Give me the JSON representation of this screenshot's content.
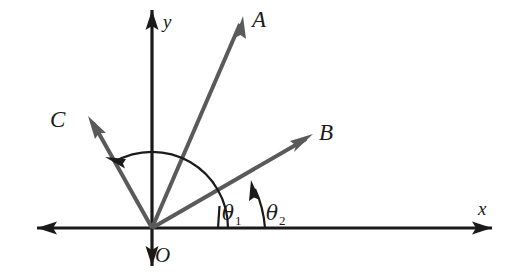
{
  "figure": {
    "kind": "vector-angle-diagram",
    "background_color": "#ffffff",
    "axis_color": "#1a1a1a",
    "vector_color": "#5a5a5a",
    "arc_color": "#1a1a1a",
    "label_color": "#1a1a1a",
    "origin": {
      "x": 152,
      "y": 228,
      "label": "O"
    },
    "axes": [
      {
        "name": "x-axis",
        "label": "x",
        "label_x": 478,
        "label_y": 215,
        "x1": 37,
        "y1": 228,
        "x2": 492,
        "y2": 228,
        "double_headed": true
      },
      {
        "name": "y-axis",
        "label": "y",
        "label_x": 163,
        "label_y": 28,
        "x1": 152,
        "y1": 10,
        "x2": 152,
        "y2": 266,
        "double_headed": true
      }
    ],
    "vectors": [
      {
        "id": "A",
        "label": "A",
        "tip_x": 243,
        "tip_y": 16,
        "label_x": 252,
        "label_y": 27,
        "angle_from_x_axis_deg": 65
      },
      {
        "id": "B",
        "label": "B",
        "tip_x": 313,
        "tip_y": 134,
        "label_x": 319,
        "label_y": 140,
        "angle_from_x_axis_deg": 30
      },
      {
        "id": "C",
        "label": "C",
        "tip_x": 88,
        "tip_y": 116,
        "label_x": 50,
        "label_y": 127,
        "angle_from_x_axis_deg": 120
      }
    ],
    "angles": [
      {
        "id": "theta1",
        "symbol": "θ",
        "subscript": "1",
        "label_x": 222,
        "label_y": 220,
        "from": "+x axis",
        "to": "C",
        "arc_radius": 76,
        "start_deg": 0,
        "end_deg": 120,
        "arrow_at": "end"
      },
      {
        "id": "theta2",
        "symbol": "θ",
        "subscript": "2",
        "label_x": 266,
        "label_y": 220,
        "from": "+x axis",
        "to": "B",
        "arc_radius": 113,
        "start_deg": 0,
        "end_deg": 30,
        "arrow_at": "end"
      }
    ]
  }
}
